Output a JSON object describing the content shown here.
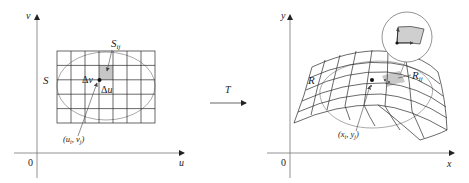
{
  "left_panel": {
    "axis_v_label": "v",
    "axis_u_label": "u",
    "origin_label": "0",
    "region_label": "S",
    "subrect_label_main": "S",
    "subrect_label_sub": "ij",
    "delta_v_label": "Δv",
    "delta_u_label": "Δu",
    "point_label": "(u",
    "point_label_i": "i",
    "point_label_mid": ", v",
    "point_label_j": "j",
    "point_label_end": ")"
  },
  "transform": {
    "label": "T"
  },
  "right_panel": {
    "axis_y_label": "y",
    "axis_x_label": "x",
    "origin_label": "0",
    "region_label": "R",
    "subregion_label_main": "R",
    "subregion_label_sub": "ij",
    "point_label": "(x",
    "point_label_i": "i",
    "point_label_mid": ", y",
    "point_label_j": "j",
    "point_label_end": ")"
  },
  "colors": {
    "line": "#333333",
    "grid": "#2a2a2a",
    "ellipse": "#9a9a9a",
    "shade": "#c8c8c8",
    "axis": "#555555"
  }
}
